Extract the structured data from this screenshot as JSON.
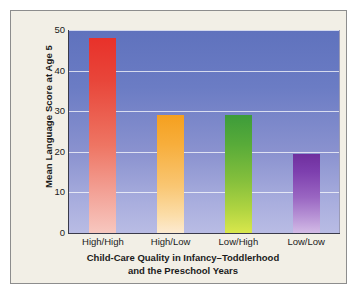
{
  "chart_data": {
    "type": "bar",
    "title": "",
    "subtitle": "",
    "xlabel_line1": "Child-Care Quality in Infancy–Toddlerhood",
    "xlabel_line2": "and the Preschool Years",
    "ylabel": "Mean Language Score at Age 5",
    "categories": [
      "High/High",
      "High/Low",
      "Low/High",
      "Low/Low"
    ],
    "values": [
      48,
      29,
      29,
      19.5
    ],
    "series": [
      {
        "name": "Mean Language Score at Age 5",
        "values": [
          48,
          29,
          29,
          19.5
        ]
      }
    ],
    "bar_colors": [
      "#e8312a",
      "#f5a01f",
      "#3d9c3a",
      "#6f2f9e"
    ],
    "ylim": [
      0,
      50
    ],
    "yticks": [
      0,
      10,
      20,
      30,
      40,
      50
    ],
    "ytick_labels": [
      "0",
      "10",
      "20",
      "30",
      "40",
      "50"
    ],
    "grid": true,
    "grid_axis": "y",
    "legend": false,
    "legend_position": "none",
    "plot_background_top_color": "#5f72bd",
    "plot_background_bottom_color": "#b9bce4",
    "card_background_color": "#f2efe6",
    "card_border_color": "#8d8d8d",
    "axis_color": "#3a3a4a",
    "text_color": "#1b1b1b"
  }
}
